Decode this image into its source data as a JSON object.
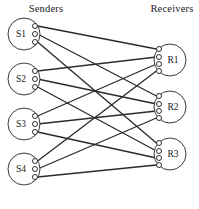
{
  "figure": {
    "type": "bipartite-graph",
    "width": 199,
    "height": 209,
    "background_color": "#ffffff",
    "line_color": "#2b2b2b",
    "node_stroke_color": "#3a3a3a"
  },
  "columns": {
    "left_title": "Senders",
    "right_title": "Receivers"
  },
  "senders": [
    {
      "id": "S1",
      "label": "S1",
      "cx": 24,
      "cy": 34,
      "r": 16,
      "ports": 3,
      "port_cx": 35,
      "port_ys": [
        26,
        34,
        42
      ]
    },
    {
      "id": "S2",
      "label": "S2",
      "cx": 24,
      "cy": 79,
      "r": 16,
      "ports": 3,
      "port_cx": 35,
      "port_ys": [
        71,
        79,
        87
      ]
    },
    {
      "id": "S3",
      "label": "S3",
      "cx": 24,
      "cy": 124,
      "r": 16,
      "ports": 3,
      "port_cx": 35,
      "port_ys": [
        116,
        124,
        132
      ]
    },
    {
      "id": "S4",
      "label": "S4",
      "cx": 24,
      "cy": 169,
      "r": 16,
      "ports": 3,
      "port_cx": 35,
      "port_ys": [
        161,
        169,
        177
      ]
    }
  ],
  "receivers": [
    {
      "id": "R1",
      "label": "R1",
      "cx": 170,
      "cy": 60,
      "r": 16,
      "ports": 4,
      "port_cx": 159,
      "port_ys": [
        49,
        57,
        64,
        71
      ]
    },
    {
      "id": "R2",
      "label": "R2",
      "cx": 170,
      "cy": 107,
      "r": 16,
      "ports": 4,
      "port_cx": 159,
      "port_ys": [
        96,
        104,
        111,
        118
      ]
    },
    {
      "id": "R3",
      "label": "R3",
      "cx": 170,
      "cy": 154,
      "r": 16,
      "ports": 4,
      "port_cx": 159,
      "port_ys": [
        143,
        151,
        158,
        165
      ]
    }
  ],
  "edges": [
    {
      "from": "S1",
      "from_port": 0,
      "to": "R1",
      "to_port": 0
    },
    {
      "from": "S1",
      "from_port": 1,
      "to": "R2",
      "to_port": 0
    },
    {
      "from": "S1",
      "from_port": 2,
      "to": "R3",
      "to_port": 0
    },
    {
      "from": "S2",
      "from_port": 0,
      "to": "R1",
      "to_port": 1
    },
    {
      "from": "S2",
      "from_port": 1,
      "to": "R2",
      "to_port": 1
    },
    {
      "from": "S2",
      "from_port": 2,
      "to": "R3",
      "to_port": 1
    },
    {
      "from": "S3",
      "from_port": 0,
      "to": "R1",
      "to_port": 2
    },
    {
      "from": "S3",
      "from_port": 1,
      "to": "R2",
      "to_port": 2
    },
    {
      "from": "S3",
      "from_port": 2,
      "to": "R3",
      "to_port": 2
    },
    {
      "from": "S4",
      "from_port": 0,
      "to": "R1",
      "to_port": 3
    },
    {
      "from": "S4",
      "from_port": 1,
      "to": "R2",
      "to_port": 3
    },
    {
      "from": "S4",
      "from_port": 2,
      "to": "R3",
      "to_port": 3
    }
  ],
  "counts": {
    "sender_count": 4,
    "receiver_count": 3,
    "edge_count": 12,
    "ports_per_sender": 3,
    "ports_per_receiver": 4
  },
  "titles": {
    "left_x": 46,
    "left_y": 12,
    "right_x": 172,
    "right_y": 12
  }
}
